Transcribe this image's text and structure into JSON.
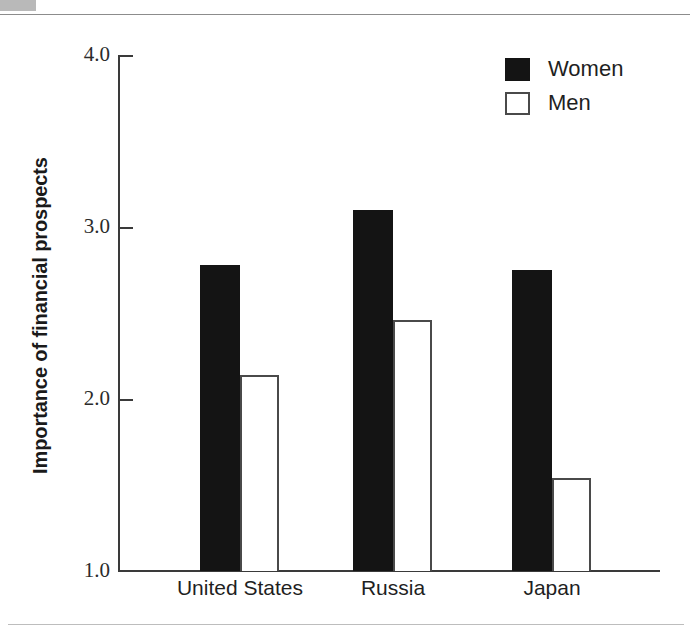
{
  "page": {
    "corner_block_color": "#b9b9b9",
    "rule_color": "#8c8c8c",
    "background": "#ffffff"
  },
  "chart_data": {
    "type": "bar",
    "title": "",
    "subtitle": "",
    "xlabel": "",
    "ylabel": "Importance of financial prospects",
    "categories": [
      "United States",
      "Russia",
      "Japan"
    ],
    "series": [
      {
        "name": "Women",
        "values": [
          2.78,
          3.1,
          2.75
        ],
        "color": "#141414",
        "style": "filled"
      },
      {
        "name": "Men",
        "values": [
          2.14,
          2.46,
          1.54
        ],
        "color": "#ffffff",
        "style": "hollow"
      }
    ],
    "ylim": [
      1.0,
      4.0
    ],
    "yticks": [
      1.0,
      2.0,
      3.0,
      4.0
    ],
    "ytick_labels": [
      "1.0",
      "2.0",
      "3.0",
      "4.0"
    ],
    "grid": false,
    "legend_position": "top-right",
    "legend_entries": [
      "Women",
      "Men"
    ]
  }
}
